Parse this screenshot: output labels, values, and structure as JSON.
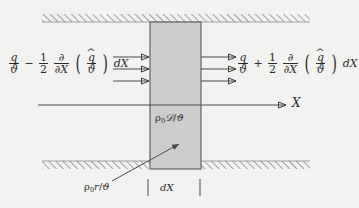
{
  "figure": {
    "background_color": "#f2f2f0",
    "ink_color": "#2b2b2b",
    "slab_fill_color": "#cdcdcd",
    "slab_stroke_color": "#555555",
    "hatch_color": "#707070"
  },
  "labels": {
    "flux_in": {
      "text": "q/ϑ − 1/2 ∂/∂X (q̂/ϑ) dX",
      "parts": {
        "term1_num": "q",
        "term1_den": "ϑ",
        "operator": "−",
        "half_num": "1",
        "half_den": "2",
        "partial_num": "∂",
        "partial_den": "∂X",
        "paren_open": "(",
        "inner_num": "q",
        "inner_hat": "^",
        "inner_den": "ϑ",
        "paren_close": ")",
        "differential": "dX"
      }
    },
    "flux_out": {
      "text": "q/ϑ + 1/2 ∂/∂X (q̂/ϑ) dX",
      "parts": {
        "term1_num": "q",
        "term1_den": "ϑ",
        "operator": "+",
        "half_num": "1",
        "half_den": "2",
        "partial_num": "∂",
        "partial_den": "∂X",
        "paren_open": "(",
        "inner_num": "q",
        "inner_hat": "^",
        "inner_den": "ϑ",
        "paren_close": ")",
        "differential": "dX"
      }
    },
    "dissipation": {
      "text": "ρ₀𝒟/ϑ",
      "parts": {
        "rho": "ρ",
        "subscript": "0",
        "script_d": "𝒟",
        "slash": "/",
        "theta": "ϑ"
      }
    },
    "source": {
      "text": "ρ₀r/ϑ",
      "parts": {
        "rho": "ρ",
        "subscript": "0",
        "r": "r",
        "slash": "/",
        "theta": "ϑ"
      }
    },
    "thickness": "dX",
    "axis": "X"
  },
  "geometry": {
    "slab": {
      "x": 150,
      "y": 22,
      "width": 51,
      "height": 147
    },
    "axis_line": {
      "x1": 38,
      "y1": 105,
      "x2": 288,
      "y2": 105
    },
    "top_wall": {
      "x": 42,
      "y": 14,
      "width": 268,
      "height": 8
    },
    "bottom_wall": {
      "x": 42,
      "y": 161,
      "width": 268,
      "height": 8
    },
    "arrows_in_y": [
      57,
      69,
      81
    ],
    "arrows_out_y": [
      57,
      69,
      81
    ],
    "arrow_in_x": [
      113,
      150
    ],
    "arrow_out_x": [
      201,
      238
    ],
    "pointer_arrow": {
      "x1": 112,
      "y1": 181,
      "x2": 180,
      "y2": 143
    },
    "tick_marks_x": [
      148,
      200
    ],
    "tick_marks_y": [
      178,
      196
    ]
  }
}
